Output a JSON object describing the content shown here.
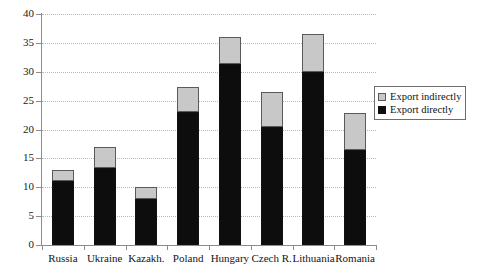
{
  "chart_data": {
    "type": "bar",
    "stacked": true,
    "title": "",
    "subtitle": "",
    "xlabel": "",
    "ylabel": "",
    "ylim": [
      0,
      40
    ],
    "ytick_step": 5,
    "yticks": [
      0,
      5,
      10,
      15,
      20,
      25,
      30,
      35,
      40
    ],
    "grid": true,
    "legend_position": "right",
    "categories": [
      "Russia",
      "Ukraine",
      "Kazakh.",
      "Poland",
      "Hungary",
      "Czech R.",
      "Lithuania",
      "Romania"
    ],
    "series": [
      {
        "name": "Export directly",
        "color": "#0d0d0d",
        "values": [
          11.0,
          13.3,
          8.0,
          23.0,
          31.3,
          20.5,
          30.0,
          16.5
        ]
      },
      {
        "name": "Export indirectly",
        "color": "#c8c8c8",
        "values": [
          2.0,
          3.7,
          2.0,
          4.3,
          4.7,
          6.0,
          6.5,
          6.3
        ]
      }
    ],
    "totals": [
      13.0,
      17.0,
      10.0,
      27.3,
      36.0,
      26.5,
      36.5,
      22.8
    ]
  },
  "legend": {
    "items": [
      {
        "label": "Export indirectly",
        "swatch": "indirect-swatch"
      },
      {
        "label": "Export directly",
        "swatch": "direct-swatch"
      }
    ]
  }
}
